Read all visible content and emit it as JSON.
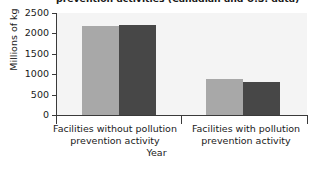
{
  "chart_data": {
    "type": "bar",
    "title": "prevention activities (Canadian and U.S. data)",
    "xlabel": "Year",
    "ylabel": "Millions of kg",
    "categories": [
      "Facilities without pollution prevention activity",
      "Facilities with pollution prevention activity"
    ],
    "series": [
      {
        "name": "2002",
        "color": "#a8a8a8",
        "values": [
          2180,
          880
        ]
      },
      {
        "name": "2004",
        "color": "#474747",
        "values": [
          2200,
          810
        ]
      }
    ],
    "ylim": [
      0,
      2500
    ],
    "yticks": [
      0,
      500,
      1000,
      1500,
      2000,
      2500
    ],
    "ytick_labels": [
      "0",
      "500",
      "1000",
      "1500",
      "2000",
      "2500"
    ],
    "grid": false,
    "legend_position": "top-right",
    "plot_background": "#f4f4f4",
    "axis_color": "#3a3a3a"
  },
  "legend": {
    "entries": [
      {
        "label": "2002"
      },
      {
        "label": "2004"
      }
    ]
  }
}
